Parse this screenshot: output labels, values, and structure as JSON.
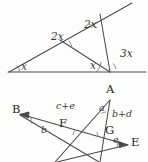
{
  "document": {
    "title": "Geometry angle diagrams",
    "background_color": "#fdfdfc",
    "stroke_color": "#4a4a4a",
    "label_color": "#3b3b3b",
    "point_label_color": "#262626"
  },
  "figures": [
    {
      "id": "triangle-angle-figure",
      "name": "triangle-with-cevians",
      "description": "Triangle with a long base ray, an upper ray extending past the apex, and two cevians meeting at the bottom right vertex.",
      "angle_labels": [
        {
          "key": "x_left",
          "text": "x",
          "x": 21,
          "y": 66
        },
        {
          "key": "x2_mid",
          "text": "2x",
          "x": 51,
          "y": 36
        },
        {
          "key": "x2_upper",
          "text": "2x",
          "x": 84,
          "y": 24
        },
        {
          "key": "x_bottom",
          "text": "x",
          "x": 90,
          "y": 65
        },
        {
          "key": "x3_right",
          "text": "3x",
          "x": 120,
          "y": 53
        }
      ],
      "vertices": {
        "left_base": [
          10,
          72
        ],
        "right_base": [
          110,
          72
        ],
        "base_end": [
          146,
          72
        ],
        "mid_upper": [
          60,
          40
        ],
        "apex": [
          100,
          14
        ],
        "ray_end": [
          132,
          3
        ]
      }
    },
    {
      "id": "star-angle-figure",
      "name": "five-point-star-angle-figure",
      "description": "Crossed-line star figure with labelled points A, B, E, F, G and angle sums.",
      "point_labels": [
        {
          "key": "A",
          "text": "A",
          "x": 106,
          "y": 9
        },
        {
          "key": "B",
          "text": "B",
          "x": 12,
          "y": 29
        },
        {
          "key": "E",
          "text": "E",
          "x": 131,
          "y": 62
        },
        {
          "key": "F",
          "text": "F",
          "x": 59,
          "y": 43
        },
        {
          "key": "G",
          "text": "G",
          "x": 105,
          "y": 50
        }
      ],
      "angle_labels": [
        {
          "key": "a",
          "text": "a",
          "x": 99,
          "y": 27
        },
        {
          "key": "b",
          "text": "b",
          "x": 41,
          "y": 49
        },
        {
          "key": "e",
          "text": "e",
          "x": 113,
          "y": 59
        },
        {
          "key": "cpe",
          "text": "c+e",
          "x": 56,
          "y": 25
        },
        {
          "key": "bpd",
          "text": "b+d",
          "x": 112,
          "y": 33
        }
      ],
      "vertices": {
        "A": [
          110,
          18
        ],
        "B": [
          22,
          34
        ],
        "E": [
          127,
          64
        ],
        "F": [
          66,
          47
        ],
        "G": [
          104,
          55
        ],
        "lower_left_tip": [
          58,
          81
        ],
        "lower_right_tip": [
          96,
          81
        ],
        "cross_left": [
          68,
          69
        ],
        "cross_right": [
          104,
          62
        ]
      }
    }
  ]
}
